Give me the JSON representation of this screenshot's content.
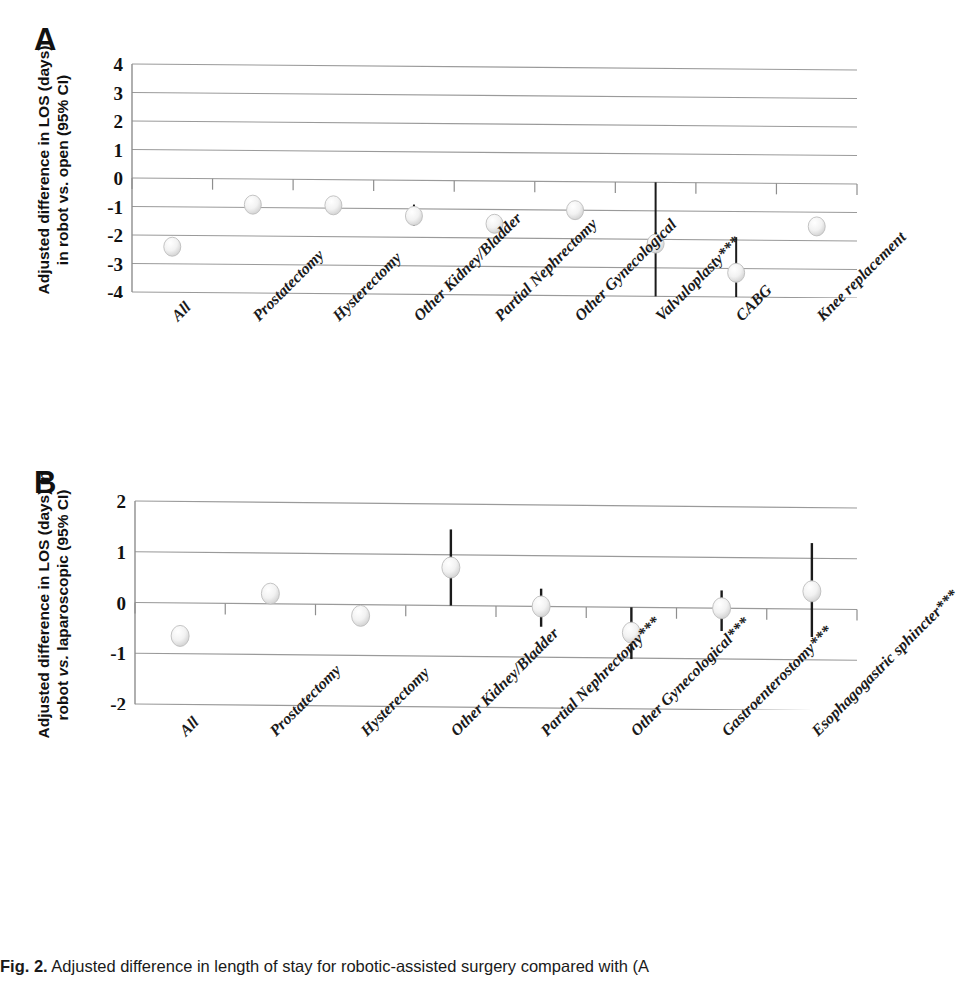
{
  "figure": {
    "caption_label": "Fig. 2.",
    "caption_text": "Adjusted difference in length of stay for robotic-assisted surgery compared with (A"
  },
  "panel_a": {
    "letter": "A",
    "ytitle_line1": "Adjusted difference in LOS (days)",
    "ytitle_line2": "in robot vs. open (95% CI)"
  },
  "panel_b": {
    "letter": "B",
    "ytitle_line1": "Adjusted difference in LOS (days) in",
    "ytitle_line2_pre": "robot ",
    "ytitle_line2_em": "vs.",
    "ytitle_line2_post": " laparoscopic (95% CI)"
  },
  "chart_data": [
    {
      "type": "scatter",
      "panel": "A",
      "title": "Adjusted difference in LOS (days) in robot vs. open (95% CI)",
      "xlabel": "",
      "ylabel": "Adjusted difference in LOS (days) in robot vs. open (95% CI)",
      "ylim": [
        -4,
        4
      ],
      "yticks": [
        4,
        3,
        2,
        1,
        0,
        -1,
        -2,
        -3,
        -4
      ],
      "ytick_labels": [
        "4",
        "3",
        "2",
        "1",
        "0",
        "-1",
        "-2",
        "-3",
        "-4"
      ],
      "grid": true,
      "legend": "none",
      "categories": [
        "All",
        "Prostatectomy",
        "Hysterectomy",
        "Other Kidney/Bladder",
        "Partial Nephrectomy",
        "Other Gynecological",
        "Valvuloplasty***",
        "CABG",
        "Knee replacement"
      ],
      "values": [
        -2.4,
        -0.9,
        -0.9,
        -1.25,
        -1.5,
        -1.0,
        -2.15,
        -3.15,
        -1.5
      ],
      "ci_low": [
        -2.45,
        -0.95,
        -0.95,
        -1.6,
        -1.7,
        -1.05,
        -4.0,
        -4.0,
        -1.7
      ],
      "ci_high": [
        -2.35,
        -0.85,
        -0.85,
        -0.85,
        -1.35,
        -0.95,
        0.0,
        -1.9,
        -1.35
      ]
    },
    {
      "type": "scatter",
      "panel": "B",
      "title": "Adjusted difference in LOS (days) in robot vs. laparoscopic (95% CI)",
      "xlabel": "",
      "ylabel": "Adjusted difference in LOS (days) in robot vs. laparoscopic (95% CI)",
      "ylim": [
        -2,
        2
      ],
      "yticks": [
        2,
        1,
        0,
        -1,
        -2
      ],
      "ytick_labels": [
        "2",
        "1",
        "0",
        "-1",
        "-2"
      ],
      "grid": true,
      "legend": "none",
      "categories": [
        "All",
        "Prostatectomy",
        "Hysterectomy",
        "Other Kidney/Bladder",
        "Partial Nephrectomy***",
        "Other Gynecological***",
        "Gastroenterostomy***",
        "Esophagogastric sphincter***"
      ],
      "values": [
        -0.65,
        0.2,
        -0.22,
        0.75,
        0.0,
        -0.5,
        0.0,
        0.35
      ],
      "ci_low": [
        -0.7,
        0.12,
        -0.28,
        0.0,
        -0.4,
        -1.02,
        -0.45,
        -0.55
      ],
      "ci_high": [
        -0.6,
        0.33,
        -0.16,
        1.5,
        0.35,
        0.0,
        0.35,
        1.3
      ]
    }
  ]
}
